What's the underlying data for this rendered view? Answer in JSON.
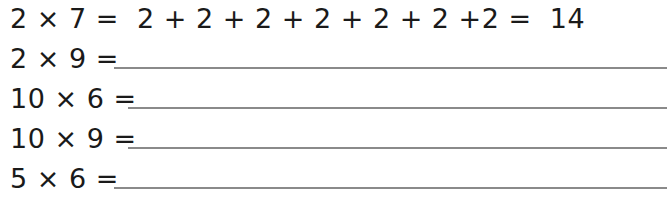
{
  "worksheet": {
    "rows": [
      {
        "expression": "2 × 7 =  2 + 2 + 2 + 2 + 2 + 2 +2 =  14",
        "answer_blank": false
      },
      {
        "expression": "2 × 9 =",
        "answer_blank": true
      },
      {
        "expression": "10 × 6 =",
        "answer_blank": true
      },
      {
        "expression": "10 × 9 =",
        "answer_blank": true
      },
      {
        "expression": "5 × 6 =",
        "answer_blank": true
      }
    ]
  }
}
